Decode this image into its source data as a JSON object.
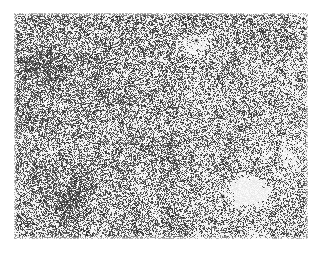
{
  "page": {
    "width": 322,
    "height": 255,
    "background_color": "#ffffff",
    "kind": "scanned-grayscale-texture-plate"
  },
  "figure": {
    "name": "speckle-texture-micrograph",
    "caption": "",
    "x": 14,
    "y": 13,
    "width": 294,
    "height": 226,
    "background_color": "#ffffff",
    "ink_color": "#3a3a3a",
    "border": "none"
  },
  "texture": {
    "type": "random-dither-speckle",
    "cell_size_px": 1,
    "base_coverage": 0.46,
    "grain_scale": 1.0,
    "clump_scale": 3.0,
    "seed": 20240917,
    "ink_min_gray": 40,
    "ink_max_gray": 130,
    "paper_gray": 255,
    "density_gradient": {
      "description": "slightly denser toward upper-left, sparser toward lower-right",
      "top_left": 0.54,
      "top_right": 0.47,
      "bottom_left": 0.5,
      "bottom_right": 0.38
    },
    "features": [
      {
        "name": "bright-blob-lower-right",
        "kind": "light-region",
        "cx": 247,
        "cy": 190,
        "rx": 26,
        "ry": 20,
        "strength": 0.62
      },
      {
        "name": "light-halo-upper-right",
        "kind": "light-region",
        "cx": 196,
        "cy": 44,
        "rx": 22,
        "ry": 17,
        "strength": 0.3
      },
      {
        "name": "light-streak-right-edge",
        "kind": "light-region",
        "cx": 292,
        "cy": 150,
        "rx": 18,
        "ry": 26,
        "strength": 0.22
      },
      {
        "name": "dark-band-left-upper",
        "kind": "dark-region",
        "cx": 46,
        "cy": 70,
        "rx": 28,
        "ry": 34,
        "strength": 0.16
      },
      {
        "name": "dark-band-lower-left",
        "kind": "dark-region",
        "cx": 70,
        "cy": 200,
        "rx": 40,
        "ry": 28,
        "strength": 0.14
      }
    ],
    "specks": [
      {
        "name": "dark-speck-top-right",
        "cx": 196,
        "cy": 40,
        "r": 2.4,
        "gray": 20
      },
      {
        "name": "dark-speck-top-right-small",
        "cx": 172,
        "cy": 44,
        "r": 1.3,
        "gray": 40
      },
      {
        "name": "dark-speck-center-low",
        "cx": 158,
        "cy": 197,
        "r": 2.2,
        "gray": 25
      },
      {
        "name": "dark-speck-left-mid",
        "cx": 166,
        "cy": 188,
        "r": 1.6,
        "gray": 45
      },
      {
        "name": "dark-speck-right-mid",
        "cx": 284,
        "cy": 133,
        "r": 1.7,
        "gray": 35
      },
      {
        "name": "dark-speck-lower-left",
        "cx": 78,
        "cy": 210,
        "r": 1.5,
        "gray": 45
      },
      {
        "name": "dark-speck-blob-edge",
        "cx": 222,
        "cy": 196,
        "r": 2.6,
        "gray": 28
      }
    ]
  }
}
